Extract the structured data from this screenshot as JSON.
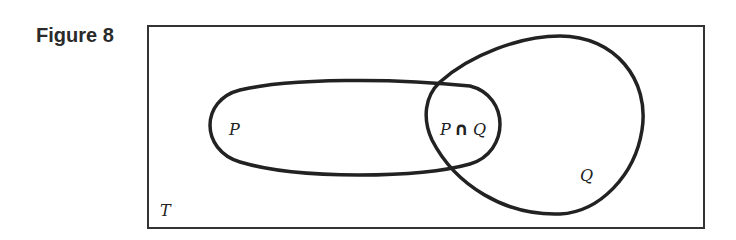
{
  "figure": {
    "label": "Figure 8"
  },
  "diagram": {
    "type": "venn",
    "universe_label": "T",
    "sets": [
      {
        "name": "P",
        "label": "P"
      },
      {
        "name": "Q",
        "label": "Q"
      }
    ],
    "intersection": {
      "left": "P",
      "operator": "∩",
      "right": "Q"
    },
    "stroke_color": "#222222",
    "background": "#ffffff"
  }
}
